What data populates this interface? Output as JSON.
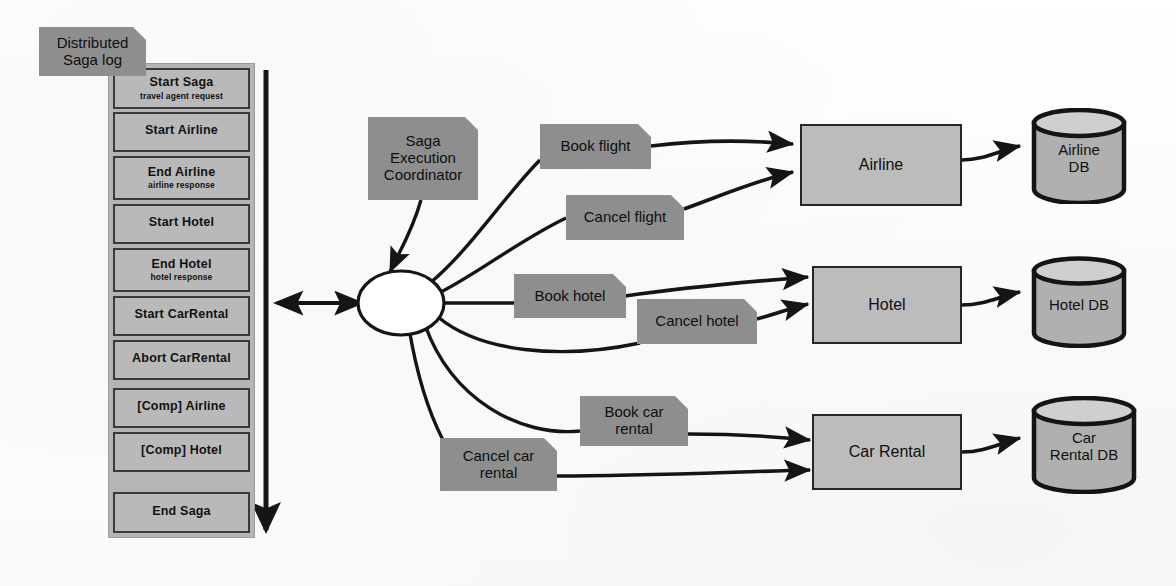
{
  "diagram": {
    "title_note": "Distributed\nSaga log",
    "title_note_line1": "Distributed",
    "title_note_line2": "Saga log",
    "coordinator_note_line1": "Saga",
    "coordinator_note_line2": "Execution",
    "coordinator_note_line3": "Coordinator"
  },
  "colors": {
    "note_fill": "#8e8e8e",
    "log_entry_fill": "#b9b9b9",
    "log_panel_fill": "#b5b5b5",
    "service_fill": "#bcbcbc",
    "db_fill": "#b0b0b0",
    "stroke": "#1a1a1a",
    "background": "#fdfdfc"
  },
  "saga_log": {
    "entries": [
      {
        "title": "Start Saga",
        "subtitle": "travel agent request"
      },
      {
        "title": "Start Airline",
        "subtitle": ""
      },
      {
        "title": "End Airline",
        "subtitle": "airline response"
      },
      {
        "title": "Start Hotel",
        "subtitle": ""
      },
      {
        "title": "End Hotel",
        "subtitle": "hotel response"
      },
      {
        "title": "Start CarRental",
        "subtitle": ""
      },
      {
        "title": "Abort CarRental",
        "subtitle": ""
      },
      {
        "title": "[Comp] Airline",
        "subtitle": ""
      },
      {
        "title": "[Comp] Hotel",
        "subtitle": ""
      },
      {
        "title": "End Saga",
        "subtitle": ""
      }
    ]
  },
  "messages": [
    {
      "id": "book-flight",
      "label": "Book flight"
    },
    {
      "id": "cancel-flight",
      "label": "Cancel flight"
    },
    {
      "id": "book-hotel",
      "label": "Book hotel"
    },
    {
      "id": "cancel-hotel",
      "label": "Cancel hotel"
    },
    {
      "id": "book-car-rental",
      "label": "Book car\nrental",
      "line1": "Book car",
      "line2": "rental"
    },
    {
      "id": "cancel-car-rental",
      "label": "Cancel car\nrental",
      "line1": "Cancel car",
      "line2": "rental"
    }
  ],
  "services": [
    {
      "id": "airline",
      "label": "Airline"
    },
    {
      "id": "hotel",
      "label": "Hotel"
    },
    {
      "id": "car-rental",
      "label": "Car Rental"
    }
  ],
  "databases": [
    {
      "id": "airline-db",
      "line1": "Airline",
      "line2": "DB"
    },
    {
      "id": "hotel-db",
      "line1": "Hotel DB",
      "line2": ""
    },
    {
      "id": "car-rental-db",
      "line1": "Car",
      "line2": "Rental DB"
    }
  ]
}
